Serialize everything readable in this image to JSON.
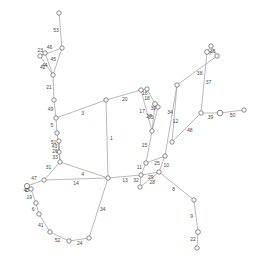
{
  "figure": {
    "type": "node-link-graph",
    "background_color": "#ffffff",
    "node_fill": "#ffffff",
    "node_stroke": "#6d6d6d",
    "edge_color": "#9b9b9b",
    "label_color": "#4a4a4a",
    "width": 261,
    "height": 265
  },
  "chart_data": {
    "type": "scatter",
    "title": "",
    "xlabel": "",
    "ylabel": "",
    "nodes": [
      {
        "id": "n0",
        "x": 59,
        "y": 13,
        "r": 2.2
      },
      {
        "id": "n1",
        "x": 62,
        "y": 48,
        "r": 2.2
      },
      {
        "id": "n2",
        "x": 45,
        "y": 53,
        "r": 2.2
      },
      {
        "id": "n3",
        "x": 40,
        "y": 56,
        "r": 2.2
      },
      {
        "id": "n4",
        "x": 53,
        "y": 75,
        "r": 2.2
      },
      {
        "id": "n5",
        "x": 54,
        "y": 100,
        "r": 2.2
      },
      {
        "id": "n6",
        "x": 56,
        "y": 118,
        "r": 2.2
      },
      {
        "id": "n7",
        "x": 57,
        "y": 133,
        "r": 2.2
      },
      {
        "id": "n8",
        "x": 59,
        "y": 141,
        "r": 2.2
      },
      {
        "id": "n9",
        "x": 59,
        "y": 152,
        "r": 2.2
      },
      {
        "id": "n10",
        "x": 60,
        "y": 162,
        "r": 2.2
      },
      {
        "id": "n11",
        "x": 44,
        "y": 180,
        "r": 2.2
      },
      {
        "id": "n12",
        "x": 27,
        "y": 186,
        "r": 2.6
      },
      {
        "id": "n13",
        "x": 31,
        "y": 189,
        "r": 2.2
      },
      {
        "id": "n14",
        "x": 36,
        "y": 203,
        "r": 2.2
      },
      {
        "id": "n15",
        "x": 39,
        "y": 214,
        "r": 2.2
      },
      {
        "id": "n16",
        "x": 50,
        "y": 232,
        "r": 2.2
      },
      {
        "id": "n17",
        "x": 69,
        "y": 241,
        "r": 2.2
      },
      {
        "id": "n18",
        "x": 89,
        "y": 238,
        "r": 2.2
      },
      {
        "id": "n19",
        "x": 108,
        "y": 178,
        "r": 2.2
      },
      {
        "id": "n20",
        "x": 106,
        "y": 100,
        "r": 2.2
      },
      {
        "id": "n21",
        "x": 141,
        "y": 90,
        "r": 2.2
      },
      {
        "id": "n22",
        "x": 147,
        "y": 89,
        "r": 2.2
      },
      {
        "id": "n23",
        "x": 155,
        "y": 104,
        "r": 2.4
      },
      {
        "id": "n24",
        "x": 158,
        "y": 107,
        "r": 2.2
      },
      {
        "id": "n25",
        "x": 152,
        "y": 131,
        "r": 2.2
      },
      {
        "id": "n26",
        "x": 146,
        "y": 163,
        "r": 2.2
      },
      {
        "id": "n27",
        "x": 141,
        "y": 175,
        "r": 2.2
      },
      {
        "id": "n28",
        "x": 140,
        "y": 187,
        "r": 2.2
      },
      {
        "id": "n29",
        "x": 159,
        "y": 172,
        "r": 2.2
      },
      {
        "id": "n30",
        "x": 165,
        "y": 156,
        "r": 2.2
      },
      {
        "id": "n31",
        "x": 177,
        "y": 85,
        "r": 2.2
      },
      {
        "id": "n32",
        "x": 172,
        "y": 142,
        "r": 2.2
      },
      {
        "id": "n33",
        "x": 201,
        "y": 113,
        "r": 2.2
      },
      {
        "id": "n34",
        "x": 207,
        "y": 52,
        "r": 2.4
      },
      {
        "id": "n35",
        "x": 211,
        "y": 46,
        "r": 2.2
      },
      {
        "id": "n36",
        "x": 217,
        "y": 56,
        "r": 2.2
      },
      {
        "id": "n37",
        "x": 220,
        "y": 113,
        "r": 2.8
      },
      {
        "id": "n38",
        "x": 244,
        "y": 110,
        "r": 2.2
      },
      {
        "id": "n39",
        "x": 194,
        "y": 200,
        "r": 2.2
      },
      {
        "id": "n40",
        "x": 198,
        "y": 232,
        "r": 2.4
      },
      {
        "id": "n41",
        "x": 197,
        "y": 248,
        "r": 2.2
      }
    ],
    "edges": [
      {
        "source": "n0",
        "target": "n1",
        "label": "53"
      },
      {
        "source": "n1",
        "target": "n3",
        "label": "46"
      },
      {
        "source": "n2",
        "target": "n3",
        "label": "23"
      },
      {
        "source": "n3",
        "target": "n4",
        "label": "42"
      },
      {
        "source": "n1",
        "target": "n4",
        "label": "45"
      },
      {
        "source": "n4",
        "target": "n5",
        "label": "21"
      },
      {
        "source": "n5",
        "target": "n6",
        "label": "49"
      },
      {
        "source": "n6",
        "target": "n7",
        "label": "5"
      },
      {
        "source": "n7",
        "target": "n9",
        "label": "51"
      },
      {
        "source": "n8",
        "target": "n9",
        "label": "43"
      },
      {
        "source": "n9",
        "target": "n10",
        "label": "33"
      },
      {
        "source": "n10",
        "target": "n11",
        "label": "31"
      },
      {
        "source": "n11",
        "target": "n12",
        "label": "47"
      },
      {
        "source": "n12",
        "target": "n13",
        "label": "40"
      },
      {
        "source": "n13",
        "target": "n14",
        "label": "19"
      },
      {
        "source": "n14",
        "target": "n15",
        "label": "6"
      },
      {
        "source": "n15",
        "target": "n16",
        "label": "41"
      },
      {
        "source": "n16",
        "target": "n17",
        "label": "52"
      },
      {
        "source": "n17",
        "target": "n18",
        "label": "24"
      },
      {
        "source": "n18",
        "target": "n19",
        "label": "34"
      },
      {
        "source": "n10",
        "target": "n19",
        "label": "4"
      },
      {
        "source": "n19",
        "target": "n20",
        "label": "1"
      },
      {
        "source": "n11",
        "target": "n19",
        "label": "14"
      },
      {
        "source": "n20",
        "target": "n21",
        "label": "20"
      },
      {
        "source": "n21",
        "target": "n22",
        "label": "16"
      },
      {
        "source": "n22",
        "target": "n23",
        "label": "18"
      },
      {
        "source": "n23",
        "target": "n24",
        "label": "30"
      },
      {
        "source": "n24",
        "target": "n25",
        "label": "35"
      },
      {
        "source": "n23",
        "target": "n25",
        "label": "27"
      },
      {
        "source": "n25",
        "target": "n26",
        "label": "15"
      },
      {
        "source": "n26",
        "target": "n27",
        "label": "11"
      },
      {
        "source": "n27",
        "target": "n28",
        "label": "32"
      },
      {
        "source": "n27",
        "target": "n29",
        "label": "29"
      },
      {
        "source": "n28",
        "target": "n29",
        "label": "28"
      },
      {
        "source": "n29",
        "target": "n30",
        "label": "10"
      },
      {
        "source": "n30",
        "target": "n31",
        "label": "12"
      },
      {
        "source": "n31",
        "target": "n32",
        "label": "34"
      },
      {
        "source": "n32",
        "target": "n33",
        "label": "48"
      },
      {
        "source": "n33",
        "target": "n34",
        "label": "37"
      },
      {
        "source": "n34",
        "target": "n35",
        "label": "36"
      },
      {
        "source": "n35",
        "target": "n36",
        "label": "7"
      },
      {
        "source": "n33",
        "target": "n37",
        "label": "39"
      },
      {
        "source": "n37",
        "target": "n38",
        "label": "50"
      },
      {
        "source": "n29",
        "target": "n39",
        "label": "8"
      },
      {
        "source": "n39",
        "target": "n40",
        "label": "9"
      },
      {
        "source": "n40",
        "target": "n41",
        "label": "22"
      },
      {
        "source": "n31",
        "target": "n36",
        "label": "38"
      },
      {
        "source": "n21",
        "target": "n25",
        "label": "17"
      },
      {
        "source": "n6",
        "target": "n20",
        "label": "3"
      },
      {
        "source": "n12",
        "target": "n13",
        "label": "2"
      },
      {
        "source": "n2",
        "target": "n4",
        "label": "44"
      },
      {
        "source": "n8",
        "target": "n10",
        "label": "26"
      },
      {
        "source": "n26",
        "target": "n30",
        "label": "25"
      },
      {
        "source": "n19",
        "target": "n27",
        "label": "13"
      }
    ]
  }
}
